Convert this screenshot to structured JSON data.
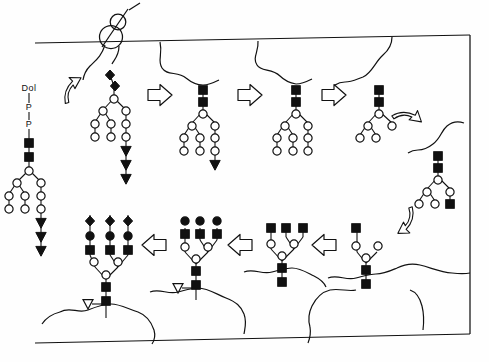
{
  "figure": {
    "domain": "Diagram",
    "background_color": "#fefefe",
    "ink_color": "#111111"
  },
  "labels": {
    "dolichol": "Dol",
    "phosphate_1": "P",
    "phosphate_2": "P"
  },
  "legend_symbols": [
    {
      "key": "filled-square",
      "name": "GlcNAc",
      "shape": "square",
      "fill": "#111111",
      "stroke": "#111111"
    },
    {
      "key": "open-circle",
      "name": "Mannose",
      "shape": "circle",
      "fill": "#ffffff",
      "stroke": "#111111"
    },
    {
      "key": "filled-circle",
      "name": "Galactose",
      "shape": "circle",
      "fill": "#111111",
      "stroke": "#111111"
    },
    {
      "key": "filled-triangle",
      "name": "Glucose",
      "shape": "triangle",
      "fill": "#111111",
      "stroke": "#111111"
    },
    {
      "key": "open-triangle",
      "name": "Fucose",
      "shape": "triangle",
      "fill": "#ffffff",
      "stroke": "#111111"
    },
    {
      "key": "filled-diamond",
      "name": "Sialic acid",
      "shape": "diamond",
      "fill": "#111111",
      "stroke": "#111111"
    }
  ],
  "membranes": [
    {
      "name": "upper-membrane",
      "x1": 35,
      "y1": 43,
      "x2": 470,
      "y2": 35
    },
    {
      "name": "lower-membrane",
      "x1": 35,
      "y1": 343,
      "x2": 470,
      "y2": 334
    },
    {
      "name": "right-border",
      "x1": 470,
      "y1": 35,
      "x2": 470,
      "y2": 334
    }
  ],
  "ribosome": {
    "name": "ribosome",
    "large_cx": 111,
    "large_cy": 36,
    "large_r": 11,
    "small_cx": 118,
    "small_cy": 22,
    "small_r": 7.5
  },
  "arrows": [
    {
      "name": "arrow-curved-1",
      "type": "curved",
      "x": 60,
      "y": 88,
      "rotate": -38
    },
    {
      "name": "arrow-right-1",
      "type": "block",
      "x": 148,
      "y": 85,
      "rotate": 0
    },
    {
      "name": "arrow-right-2",
      "type": "block",
      "x": 232,
      "y": 85,
      "rotate": 0
    },
    {
      "name": "arrow-right-3",
      "type": "block",
      "x": 314,
      "y": 85,
      "rotate": 0
    },
    {
      "name": "arrow-curved-2",
      "type": "curved",
      "x": 396,
      "y": 104,
      "rotate": 42
    },
    {
      "name": "arrow-curved-3",
      "type": "curved",
      "x": 404,
      "y": 212,
      "rotate": 140
    },
    {
      "name": "arrow-left-1",
      "type": "block",
      "x": 318,
      "y": 238,
      "rotate": 180
    },
    {
      "name": "arrow-left-2",
      "type": "block",
      "x": 236,
      "y": 238,
      "rotate": 180
    },
    {
      "name": "arrow-left-3",
      "type": "block",
      "x": 152,
      "y": 238,
      "rotate": 180
    }
  ],
  "structures": [
    {
      "name": "dolichol-linked-precursor",
      "position": "far-left",
      "anchor": "Dol-P-P",
      "composition": "Glc3Man9GlcNAc2 (drawn abbreviated)",
      "glcnac_count": 2,
      "mannose_count": 6,
      "glucose_triangles": 3
    },
    {
      "name": "nascent-glycoprotein-at-ribosome",
      "position": "top-1",
      "anchor": "nascent polypeptide at ribosome",
      "composition": "glycan transferred to protein; 2 diamonds + branched mannose + 3 glucose",
      "glcnac_count": 0,
      "diamond_count": 2,
      "mannose_count": 6,
      "glucose_triangles": 3
    },
    {
      "name": "glucose-trimmed-glycoprotein",
      "position": "top-2",
      "anchor": "folded protein",
      "composition": "2 GlcNAc + branched mannose + 1 glucose",
      "glcnac_count": 2,
      "mannose_count": 6,
      "glucose_triangles": 1
    },
    {
      "name": "high-mannose-glycoprotein",
      "position": "top-3",
      "anchor": "protein",
      "composition": "Man6GlcNAc2 high-mannose",
      "glcnac_count": 2,
      "mannose_count": 6,
      "glucose_triangles": 0
    },
    {
      "name": "trimmed-mannose-glycoprotein",
      "position": "top-4",
      "anchor": "protein",
      "composition": "Man3-4GlcNAc2 core",
      "glcnac_count": 2,
      "mannose_count": 4,
      "glucose_triangles": 0
    },
    {
      "name": "hybrid-glycan-with-first-glcnac",
      "position": "right",
      "anchor": "protein",
      "composition": "Man3GlcNAc2 core + 1 branch GlcNAc",
      "glcnac_count": 3,
      "mannose_count": 4,
      "glucose_triangles": 0
    },
    {
      "name": "branching-glcnac-glycan",
      "position": "bottom-4",
      "anchor": "protein (inverted)",
      "composition": "Man3GlcNAc2 core + 1 antenna GlcNAc",
      "glcnac_count": 3,
      "mannose_count": 3,
      "antennae": 1
    },
    {
      "name": "tri-antennary-glcnac-glycan",
      "position": "bottom-3",
      "anchor": "protein (inverted)",
      "composition": "Man3GlcNAc2 core + 3 antenna GlcNAc",
      "glcnac_count": 5,
      "mannose_count": 3,
      "antennae": 3
    },
    {
      "name": "galactosylated-fucosylated-glycan",
      "position": "bottom-2",
      "anchor": "protein (inverted)",
      "composition": "core-fucosylated, 3 antennae each GlcNAc + Gal",
      "glcnac_count": 5,
      "mannose_count": 3,
      "galactose_count": 3,
      "fucose_count": 1,
      "antennae": 3
    },
    {
      "name": "sialylated-complex-glycan",
      "position": "bottom-1",
      "anchor": "protein (inverted)",
      "composition": "mature complex: core-fucosylated, 3 antennae each GlcNAc + Gal + sialic acid",
      "glcnac_count": 5,
      "mannose_count": 3,
      "galactose_count": 3,
      "sialic_acid_count": 3,
      "fucose_count": 1,
      "antennae": 3
    }
  ]
}
